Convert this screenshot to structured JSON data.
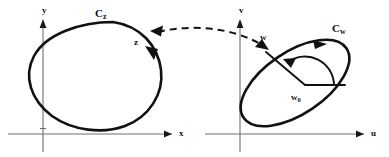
{
  "figure": {
    "title": "",
    "domain_plane": {
      "axis_x_label": "x",
      "axis_y_label": "y",
      "curve_label_base": "C",
      "curve_label_sub": "z",
      "point_label": "z",
      "orientation": "clockwise"
    },
    "range_plane": {
      "axis_u_label": "u",
      "axis_v_label": "v",
      "curve_label_base": "C",
      "curve_label_sub": "w",
      "point_label": "w",
      "center_label_base": "w",
      "center_label_sub": "0",
      "orientation": "counterclockwise"
    },
    "mapping": {
      "style": "dashed-curve",
      "arrowheads": "both",
      "from_point": "w",
      "to_point": "z"
    },
    "colors": {
      "curve": "#111111",
      "axis": "#6f6f6f",
      "background": "#ffffff",
      "label": "#101010"
    }
  }
}
